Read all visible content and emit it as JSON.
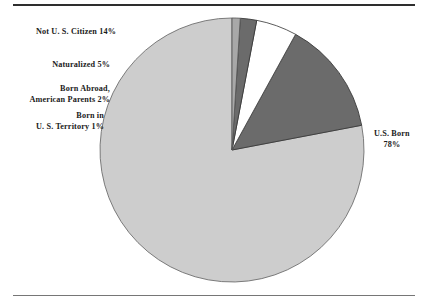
{
  "figure": {
    "background_color": "#ffffff",
    "rule_color_top": "#2e2e2e",
    "rule_color_bottom": "#767676"
  },
  "chart_data": {
    "type": "pie",
    "title": "",
    "subtitle": "",
    "xlabel": "",
    "ylabel": "",
    "legend_position": "none",
    "grid": false,
    "start_angle_deg": 90,
    "direction": "counterclockwise",
    "center": {
      "x": 232,
      "y": 150
    },
    "radius": 132,
    "categories": [
      "U.S. Born",
      "Not U.S. Citizen",
      "Naturalized",
      "Born Abroad, American Parents",
      "Born in U.S. Territory"
    ],
    "values": [
      78,
      14,
      5,
      2,
      1
    ],
    "slices": [
      {
        "name": "U.S. Born",
        "value": 78,
        "percent_label": "78%",
        "color": "#cdcdcd",
        "edge_color": "#6e6e6e",
        "label_line1": "U.S. Born",
        "label_line2": "78%"
      },
      {
        "name": "Not U.S. Citizen",
        "value": 14,
        "percent_label": "14%",
        "color": "#6b6b6b",
        "edge_color": "#3a3a3a",
        "label_line1": "Not U. S. Citizen 14%",
        "label_line2": ""
      },
      {
        "name": "Naturalized",
        "value": 5,
        "percent_label": "5%",
        "color": "#ffffff",
        "edge_color": "#4a4a4a",
        "label_line1": "Naturalized 5%",
        "label_line2": ""
      },
      {
        "name": "Born Abroad, American Parents",
        "value": 2,
        "percent_label": "2%",
        "color": "#6b6b6b",
        "edge_color": "#3a3a3a",
        "label_line1": "Born Abroad,",
        "label_line2": "American Parents 2%"
      },
      {
        "name": "Born in U.S. Territory",
        "value": 1,
        "percent_label": "1%",
        "color": "#a8a8a8",
        "edge_color": "#5a5a5a",
        "label_line1": "Born in",
        "label_line2": "U. S. Territory 1%"
      }
    ]
  },
  "labels": {
    "not_citizen": "Not U. S. Citizen 14%",
    "naturalized": "Naturalized 5%",
    "born_abroad_l1": "Born Abroad,",
    "born_abroad_l2": "American Parents 2%",
    "territory_l1": "Born in",
    "territory_l2": "U. S. Territory 1%",
    "us_born_l1": "U.S. Born",
    "us_born_l2": "78%"
  }
}
